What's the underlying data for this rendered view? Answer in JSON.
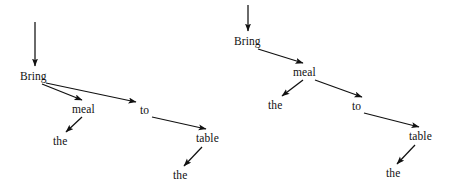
{
  "figure": {
    "background_color": "#ffffff",
    "ink_color": "#111111"
  },
  "trees": [
    {
      "id": "left-tree",
      "name": "left-dependency-tree",
      "root_incoming_arrow": true,
      "nodes": [
        {
          "id": "l-bring",
          "label": "Bring",
          "x": 20,
          "y": 70,
          "w": 38,
          "h": 13
        },
        {
          "id": "l-meal",
          "label": "meal",
          "x": 72,
          "y": 103,
          "w": 32,
          "h": 13
        },
        {
          "id": "l-the1",
          "label": "the",
          "x": 53,
          "y": 135,
          "w": 21,
          "h": 13
        },
        {
          "id": "l-to",
          "label": "to",
          "x": 140,
          "y": 104,
          "w": 14,
          "h": 13
        },
        {
          "id": "l-table",
          "label": "table",
          "x": 196,
          "y": 132,
          "w": 31,
          "h": 13
        },
        {
          "id": "l-the2",
          "label": "the",
          "x": 173,
          "y": 169,
          "w": 21,
          "h": 13
        }
      ],
      "edges": [
        {
          "from": "root-arrow",
          "to": "l-bring",
          "x1": 35,
          "y1": 22,
          "x2": 35,
          "y2": 66
        },
        {
          "from": "l-bring",
          "to": "l-meal",
          "x1": 42,
          "y1": 84,
          "x2": 82,
          "y2": 100
        },
        {
          "from": "l-bring",
          "to": "l-to",
          "x1": 46,
          "y1": 83,
          "x2": 136,
          "y2": 102
        },
        {
          "from": "l-meal",
          "to": "l-the1",
          "x1": 82,
          "y1": 117,
          "x2": 66,
          "y2": 132
        },
        {
          "from": "l-to",
          "to": "l-table",
          "x1": 152,
          "y1": 117,
          "x2": 206,
          "y2": 129
        },
        {
          "from": "l-table",
          "to": "l-the2",
          "x1": 202,
          "y1": 147,
          "x2": 184,
          "y2": 166
        }
      ]
    },
    {
      "id": "right-tree",
      "name": "right-dependency-tree",
      "root_incoming_arrow": true,
      "nodes": [
        {
          "id": "r-bring",
          "label": "Bring",
          "x": 234,
          "y": 35,
          "w": 38,
          "h": 13
        },
        {
          "id": "r-meal",
          "label": "meal",
          "x": 293,
          "y": 66,
          "w": 32,
          "h": 13
        },
        {
          "id": "r-the1",
          "label": "the",
          "x": 268,
          "y": 99,
          "w": 21,
          "h": 13
        },
        {
          "id": "r-to",
          "label": "to",
          "x": 352,
          "y": 100,
          "w": 14,
          "h": 13
        },
        {
          "id": "r-table",
          "label": "table",
          "x": 409,
          "y": 130,
          "w": 31,
          "h": 13
        },
        {
          "id": "r-the2",
          "label": "the",
          "x": 386,
          "y": 167,
          "w": 21,
          "h": 13
        }
      ],
      "edges": [
        {
          "from": "root-arrow",
          "to": "r-bring",
          "x1": 248,
          "y1": 5,
          "x2": 248,
          "y2": 31
        },
        {
          "from": "r-bring",
          "to": "r-meal",
          "x1": 258,
          "y1": 49,
          "x2": 303,
          "y2": 63
        },
        {
          "from": "r-meal",
          "to": "r-the1",
          "x1": 303,
          "y1": 80,
          "x2": 282,
          "y2": 96
        },
        {
          "from": "r-meal",
          "to": "r-to",
          "x1": 315,
          "y1": 80,
          "x2": 362,
          "y2": 97
        },
        {
          "from": "r-to",
          "to": "r-table",
          "x1": 364,
          "y1": 113,
          "x2": 419,
          "y2": 127
        },
        {
          "from": "r-table",
          "to": "r-the2",
          "x1": 415,
          "y1": 145,
          "x2": 397,
          "y2": 164
        }
      ]
    }
  ]
}
